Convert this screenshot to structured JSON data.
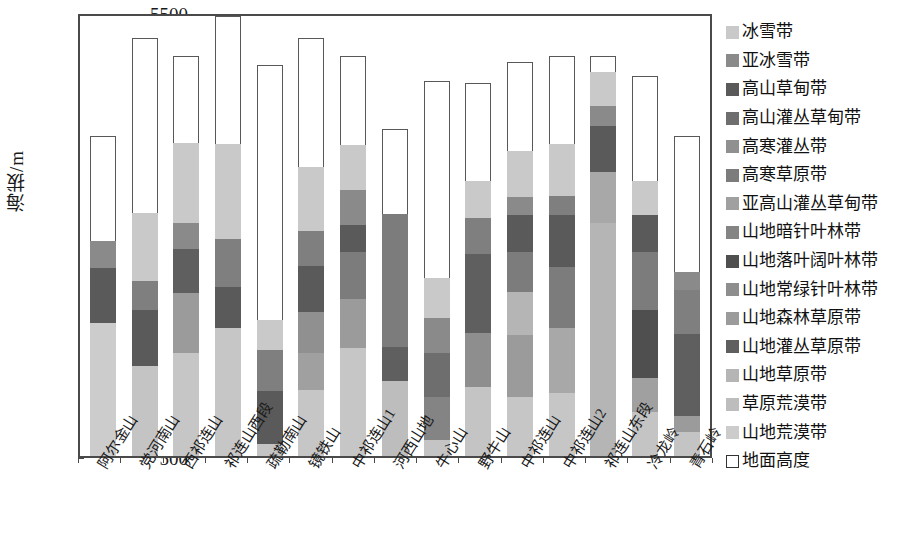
{
  "axis": {
    "y_title": "海拔/m",
    "y_ticks": [
      "5500",
      "5000",
      "4500",
      "4000",
      "3500",
      "3000",
      "2500",
      "2000",
      "1500",
      "1000",
      "500"
    ],
    "y_min": 500,
    "y_max": 5500
  },
  "chart_data": {
    "type": "bar",
    "title": "",
    "xlabel": "",
    "ylabel": "海拔/m",
    "ylim": [
      500,
      5500
    ],
    "grid": false,
    "legend_position": "right",
    "stacked": true,
    "note": "Stacked bar of vertical vegetation belts per mountain range. 'base' is the ground elevation (地面高度, drawn as an open white box from 500 m up to the base value); each band lists its top elevation in m.",
    "categories": [
      "阿尔金山",
      "党河南山",
      "西祁连山",
      "祁连山西段",
      "疏勒南山",
      "镜铁山",
      "中祁连山1",
      "河西山地",
      "牛心山",
      "野牛山",
      "中祁连山",
      "中祁连山2",
      "祁连山东段",
      "冷龙岭",
      "青石岭"
    ],
    "legend_entries": [
      {
        "label": "冰雪带",
        "color": "#c9c9c9"
      },
      {
        "label": "亚冰雪带",
        "color": "#8a8a8a"
      },
      {
        "label": "高山草甸带",
        "color": "#5a5a5a"
      },
      {
        "label": "高山灌丛草甸带",
        "color": "#6e6e6e"
      },
      {
        "label": "高寒灌丛带",
        "color": "#909090"
      },
      {
        "label": "高寒草原带",
        "color": "#7c7c7c"
      },
      {
        "label": "亚高山灌丛草甸带",
        "color": "#a0a0a0"
      },
      {
        "label": "山地暗针叶林带",
        "color": "#848484"
      },
      {
        "label": "山地落叶阔叶林带",
        "color": "#4f4f4f"
      },
      {
        "label": "山地常绿针叶林带",
        "color": "#8e8e8e"
      },
      {
        "label": "山地森林草原带",
        "color": "#9b9b9b"
      },
      {
        "label": "山地灌丛草原带",
        "color": "#5f5f5f"
      },
      {
        "label": "山地草原带",
        "color": "#b5b5b5"
      },
      {
        "label": "草原荒漠带",
        "color": "#bdbdbd"
      },
      {
        "label": "山地荒漠带",
        "color": "#cccccc"
      },
      {
        "label": "地面高度",
        "color": "#ffffff"
      }
    ],
    "bars": [
      {
        "category": "阿尔金山",
        "base": 1680,
        "top": 4100,
        "segments": [
          {
            "label": "山地荒漠带",
            "top": 3180,
            "color": "#cccccc"
          },
          {
            "label": "高寒草原带",
            "top": 3800,
            "color": "#5a5a5a"
          },
          {
            "label": "高山草甸带",
            "top": 4100,
            "color": "#8a8a8a"
          }
        ]
      },
      {
        "category": "党河南山",
        "base": 2470,
        "top": 5210,
        "segments": [
          {
            "label": "山地荒漠带",
            "top": 3480,
            "color": "#c4c4c4"
          },
          {
            "label": "高寒草原带",
            "top": 4110,
            "color": "#5a5a5a"
          },
          {
            "label": "亚冰雪带",
            "top": 4440,
            "color": "#7f7f7f"
          },
          {
            "label": "冰雪带",
            "top": 5210,
            "color": "#c9c9c9"
          }
        ]
      },
      {
        "category": "西祁连山",
        "base": 1470,
        "top": 5000,
        "segments": [
          {
            "label": "山地荒漠带",
            "top": 2630,
            "color": "#c6c6c6"
          },
          {
            "label": "山地草原带",
            "top": 3310,
            "color": "#9b9b9b"
          },
          {
            "label": "高寒草原带",
            "top": 3800,
            "color": "#5f5f5f"
          },
          {
            "label": "亚冰雪带",
            "top": 4100,
            "color": "#8a8a8a"
          },
          {
            "label": "冰雪带",
            "top": 5000,
            "color": "#c9c9c9"
          }
        ]
      },
      {
        "category": "祁连山西段",
        "base": 1960,
        "top": 5500,
        "segments": [
          {
            "label": "山地荒漠带",
            "top": 3420,
            "color": "#c6c6c6"
          },
          {
            "label": "高寒草原带",
            "top": 3880,
            "color": "#5a5a5a"
          },
          {
            "label": "亚冰雪带",
            "top": 4430,
            "color": "#7f7f7f"
          },
          {
            "label": "冰雪带",
            "top": 5500,
            "color": "#c9c9c9"
          }
        ]
      },
      {
        "category": "疏勒南山",
        "base": 3370,
        "top": 4900,
        "segments": [
          {
            "label": "高寒草原带",
            "top": 3500,
            "color": "#c4c4c4"
          },
          {
            "label": "高山草甸带",
            "top": 4100,
            "color": "#5a5a5a"
          },
          {
            "label": "亚冰雪带",
            "top": 4560,
            "color": "#7f7f7f"
          },
          {
            "label": "冰雪带",
            "top": 4900,
            "color": "#c9c9c9"
          }
        ]
      },
      {
        "category": "镜铁山",
        "base": 1960,
        "top": 5210,
        "segments": [
          {
            "label": "山地荒漠带",
            "top": 2700,
            "color": "#c6c6c6"
          },
          {
            "label": "山地草原带",
            "top": 3120,
            "color": "#a0a0a0"
          },
          {
            "label": "高寒灌丛带",
            "top": 3580,
            "color": "#909090"
          },
          {
            "label": "高山草甸带",
            "top": 4100,
            "color": "#5a5a5a"
          },
          {
            "label": "亚冰雪带",
            "top": 4490,
            "color": "#7f7f7f"
          },
          {
            "label": "冰雪带",
            "top": 5210,
            "color": "#c9c9c9"
          }
        ]
      },
      {
        "category": "中祁连山1",
        "base": 1500,
        "top": 5000,
        "segments": [
          {
            "label": "山地荒漠带",
            "top": 2720,
            "color": "#c6c6c6"
          },
          {
            "label": "山地草原带",
            "top": 3270,
            "color": "#9b9b9b"
          },
          {
            "label": "高寒灌丛带",
            "top": 3800,
            "color": "#7c7c7c"
          },
          {
            "label": "高山草甸带",
            "top": 4100,
            "color": "#5a5a5a"
          },
          {
            "label": "亚冰雪带",
            "top": 4500,
            "color": "#8a8a8a"
          },
          {
            "label": "冰雪带",
            "top": 5000,
            "color": "#c9c9c9"
          }
        ]
      },
      {
        "category": "河西山地",
        "base": 1450,
        "top": 4180,
        "segments": [
          {
            "label": "山地草原带",
            "top": 2300,
            "color": "#bdbdbd"
          },
          {
            "label": "山地灌丛草原带",
            "top": 2680,
            "color": "#5f5f5f"
          },
          {
            "label": "高寒草原带",
            "top": 4180,
            "color": "#7c7c7c"
          }
        ]
      },
      {
        "category": "牛心山",
        "base": 2720,
        "top": 4720,
        "segments": [
          {
            "label": "山地草原带",
            "top": 2900,
            "color": "#c4c4c4"
          },
          {
            "label": "山地暗针叶林带",
            "top": 3380,
            "color": "#848484"
          },
          {
            "label": "高山灌丛草甸带",
            "top": 3880,
            "color": "#6e6e6e"
          },
          {
            "label": "高山草甸带",
            "top": 4280,
            "color": "#8a8a8a"
          },
          {
            "label": "冰雪带",
            "top": 4720,
            "color": "#c9c9c9"
          }
        ]
      },
      {
        "category": "野牛山",
        "base": 1600,
        "top": 4700,
        "segments": [
          {
            "label": "山地草原带",
            "top": 2380,
            "color": "#c4c4c4"
          },
          {
            "label": "山地常绿针叶林带",
            "top": 2980,
            "color": "#8e8e8e"
          },
          {
            "label": "高山灌丛草甸带",
            "top": 3880,
            "color": "#5f5f5f"
          },
          {
            "label": "高山草甸带",
            "top": 4280,
            "color": "#7f7f7f"
          },
          {
            "label": "冰雪带",
            "top": 4700,
            "color": "#c9c9c9"
          }
        ]
      },
      {
        "category": "中祁连山",
        "base": 1500,
        "top": 4940,
        "segments": [
          {
            "label": "山地荒漠带",
            "top": 2160,
            "color": "#c6c6c6"
          },
          {
            "label": "山地草原带",
            "top": 2860,
            "color": "#9b9b9b"
          },
          {
            "label": "山地暗针叶林带",
            "top": 3350,
            "color": "#b5b5b5"
          },
          {
            "label": "高寒灌丛带",
            "top": 3800,
            "color": "#7c7c7c"
          },
          {
            "label": "高山草甸带",
            "top": 4220,
            "color": "#5a5a5a"
          },
          {
            "label": "亚冰雪带",
            "top": 4420,
            "color": "#8a8a8a"
          },
          {
            "label": "冰雪带",
            "top": 4940,
            "color": "#c9c9c9"
          }
        ]
      },
      {
        "category": "中祁连山2",
        "base": 1490,
        "top": 5000,
        "segments": [
          {
            "label": "山地荒漠带",
            "top": 2200,
            "color": "#c6c6c6"
          },
          {
            "label": "山地草原带",
            "top": 2930,
            "color": "#a8a8a8"
          },
          {
            "label": "亚高山灌丛草甸带",
            "top": 3620,
            "color": "#7c7c7c"
          },
          {
            "label": "高山草甸带",
            "top": 4200,
            "color": "#5a5a5a"
          },
          {
            "label": "高山灌丛草甸带",
            "top": 4420,
            "color": "#7f7f7f"
          },
          {
            "label": "冰雪带",
            "top": 5000,
            "color": "#c9c9c9"
          }
        ]
      },
      {
        "category": "祁连山东段",
        "base": 680,
        "top": 5000,
        "segments": [
          {
            "label": "山地草原带",
            "top": 3300,
            "color": "#b5b5b5"
          },
          {
            "label": "山地森林草原带",
            "top": 3880,
            "color": "#a8a8a8"
          },
          {
            "label": "高山草甸带",
            "top": 4400,
            "color": "#5a5a5a"
          },
          {
            "label": "亚冰雪带",
            "top": 4620,
            "color": "#8a8a8a"
          },
          {
            "label": "冰雪带",
            "top": 5000,
            "color": "#c9c9c9"
          }
        ]
      },
      {
        "category": "冷龙岭",
        "base": 1680,
        "top": 4780,
        "segments": [
          {
            "label": "山地草原带",
            "top": 2180,
            "color": "#c4c4c4"
          },
          {
            "label": "山地常绿针叶林带",
            "top": 2560,
            "color": "#a0a0a0"
          },
          {
            "label": "山地落叶阔叶林带",
            "top": 3320,
            "color": "#4f4f4f"
          },
          {
            "label": "高山灌丛草甸带",
            "top": 3980,
            "color": "#7c7c7c"
          },
          {
            "label": "高山草甸带",
            "top": 4400,
            "color": "#5a5a5a"
          },
          {
            "label": "冰雪带",
            "top": 4780,
            "color": "#c9c9c9"
          }
        ]
      },
      {
        "category": "青石岭",
        "base": 2030,
        "top": 4100,
        "segments": [
          {
            "label": "山地草原带",
            "top": 2300,
            "color": "#c4c4c4"
          },
          {
            "label": "山地常绿针叶林带",
            "top": 2480,
            "color": "#9b9b9b"
          },
          {
            "label": "高山灌丛草甸带",
            "top": 3400,
            "color": "#5f5f5f"
          },
          {
            "label": "高山草甸带",
            "top": 3900,
            "color": "#7f7f7f"
          },
          {
            "label": "亚冰雪带",
            "top": 4100,
            "color": "#8a8a8a"
          }
        ]
      }
    ]
  }
}
